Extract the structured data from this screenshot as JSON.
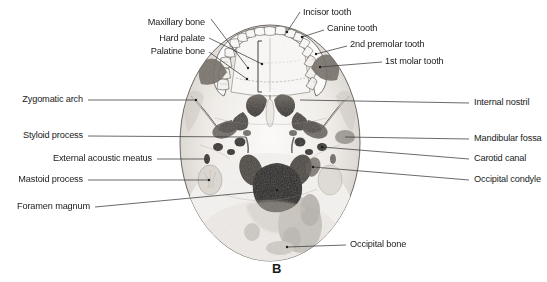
{
  "figure": {
    "caption": "B"
  },
  "labels": {
    "top_left": [
      {
        "id": "maxillary-bone",
        "text": "Maxillary bone",
        "x": 205,
        "y": 22,
        "align": "right"
      },
      {
        "id": "hard-palate",
        "text": "Hard palate",
        "x": 205,
        "y": 40,
        "align": "right"
      },
      {
        "id": "palatine-bone",
        "text": "Palatine bone",
        "x": 205,
        "y": 53,
        "align": "right"
      }
    ],
    "top_right": [
      {
        "id": "incisor-tooth",
        "text": "Incisor tooth",
        "x": 303,
        "y": 14,
        "align": "left"
      },
      {
        "id": "canine-tooth",
        "text": "Canine tooth",
        "x": 327,
        "y": 30,
        "align": "left"
      },
      {
        "id": "second-premolar-tooth",
        "text": "2nd premolar tooth",
        "x": 350,
        "y": 46,
        "align": "left"
      },
      {
        "id": "first-molar-tooth",
        "text": "1st molar tooth",
        "x": 385,
        "y": 62,
        "align": "left"
      }
    ],
    "left": [
      {
        "id": "zygomatic-arch",
        "text": "Zygomatic arch",
        "x": 83,
        "y": 98,
        "align": "right"
      },
      {
        "id": "styloid-process",
        "text": "Styloid process",
        "x": 83,
        "y": 134,
        "align": "right"
      },
      {
        "id": "external-acoustic-meatus",
        "text": "External acoustic meatus",
        "x": 152,
        "y": 157,
        "align": "right"
      },
      {
        "id": "mastoid-process",
        "text": "Mastoid process",
        "x": 83,
        "y": 178,
        "align": "right"
      },
      {
        "id": "foramen-magnum",
        "text": "Foramen magnum",
        "x": 90,
        "y": 205,
        "align": "right"
      }
    ],
    "right": [
      {
        "id": "internal-nostril",
        "text": "Internal nostril",
        "x": 474,
        "y": 101,
        "align": "left"
      },
      {
        "id": "mandibular-fossa",
        "text": "Mandibular fossa",
        "x": 474,
        "y": 137,
        "align": "left"
      },
      {
        "id": "carotid-canal",
        "text": "Carotid canal",
        "x": 474,
        "y": 157,
        "align": "left"
      },
      {
        "id": "occipital-condyle",
        "text": "Occipital condyle",
        "x": 474,
        "y": 178,
        "align": "left"
      }
    ],
    "bottom": [
      {
        "id": "occipital-bone",
        "text": "Occipital bone",
        "x": 350,
        "y": 243,
        "align": "left"
      }
    ]
  },
  "caption_pos": {
    "x": 277,
    "y": 268
  },
  "colors": {
    "background": "#ffffff",
    "text": "#1b1b1b",
    "leader_line": "#3a3a3a",
    "bone_light": "#f2f0ee",
    "bone_mid": "#b9b5b0",
    "bone_dark": "#555049",
    "cavity_dark": "#2b2724"
  },
  "leader_lines": [
    {
      "id": "maxillary-bone",
      "points": "211,19 248,68"
    },
    {
      "id": "hard-palate",
      "points": "209,38 262,64"
    },
    {
      "id": "palatine-bone",
      "points": "209,52 247,79"
    },
    {
      "id": "incisor-tooth",
      "points": "300,12 287,32"
    },
    {
      "id": "canine-tooth",
      "points": "324,30 302,37"
    },
    {
      "id": "second-premolar-tooth",
      "points": "347,46 316,54"
    },
    {
      "id": "first-molar-tooth",
      "points": "382,62 320,67"
    },
    {
      "id": "zygomatic-arch",
      "points": "88,100 196,100"
    },
    {
      "id": "styloid-process",
      "points": "88,136 246,137"
    },
    {
      "id": "external-acoustic-meatus",
      "points": "157,159 205,159"
    },
    {
      "id": "mastoid-process",
      "points": "88,180 209,180"
    },
    {
      "id": "foramen-magnum",
      "points": "95,207 277,190"
    },
    {
      "id": "internal-nostril",
      "points": "469,103 300,100"
    },
    {
      "id": "mandibular-fossa",
      "points": "469,139 345,137"
    },
    {
      "id": "carotid-canal",
      "points": "469,159 322,147"
    },
    {
      "id": "occipital-condyle",
      "points": "469,180 313,167"
    },
    {
      "id": "occipital-bone",
      "points": "346,245 287,247"
    }
  ]
}
